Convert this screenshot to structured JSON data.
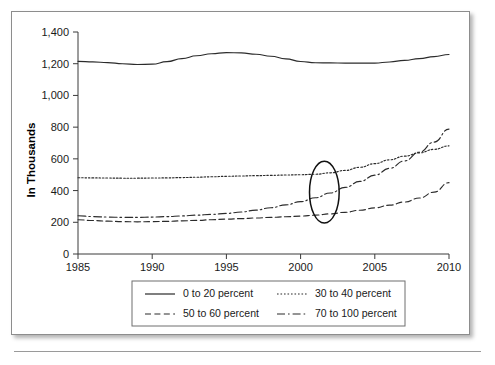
{
  "chart_data": {
    "type": "line",
    "title": "",
    "xlabel": "",
    "ylabel": "In Thousands",
    "xlim": [
      1985,
      2010
    ],
    "ylim": [
      0,
      1400
    ],
    "grid": false,
    "legend_position": "bottom",
    "x_ticks": [
      "1985",
      "1990",
      "1995",
      "2000",
      "2005",
      "2010"
    ],
    "x_tick_values": [
      1985,
      1990,
      1995,
      2000,
      2005,
      2010
    ],
    "y_ticks": [
      "0",
      "200",
      "400",
      "600",
      "800",
      "1,000",
      "1,200",
      "1,400"
    ],
    "y_tick_values": [
      0,
      200,
      400,
      600,
      800,
      1000,
      1200,
      1400
    ],
    "x": [
      1985,
      1986,
      1987,
      1988,
      1989,
      1990,
      1991,
      1992,
      1993,
      1994,
      1995,
      1996,
      1997,
      1998,
      1999,
      2000,
      2001,
      2002,
      2003,
      2004,
      2005,
      2006,
      2007,
      2008,
      2009,
      2010
    ],
    "series": [
      {
        "name": "0 to 20 percent",
        "style": "solid",
        "values": [
          1215,
          1212,
          1207,
          1200,
          1195,
          1197,
          1213,
          1232,
          1250,
          1263,
          1270,
          1268,
          1260,
          1247,
          1231,
          1214,
          1206,
          1205,
          1204,
          1204,
          1204,
          1211,
          1221,
          1232,
          1245,
          1258
        ]
      },
      {
        "name": "30 to 40 percent",
        "style": "dotted",
        "values": [
          481,
          480,
          479,
          478,
          478,
          479,
          480,
          482,
          484,
          487,
          490,
          492,
          494,
          496,
          498,
          500,
          503,
          512,
          527,
          547,
          570,
          594,
          617,
          638,
          660,
          682
        ]
      },
      {
        "name": "50 to 60 percent",
        "style": "dashed",
        "values": [
          216,
          211,
          207,
          204,
          203,
          204,
          206,
          209,
          212,
          216,
          220,
          223,
          227,
          231,
          235,
          239,
          245,
          253,
          263,
          276,
          291,
          308,
          328,
          353,
          390,
          450
        ]
      },
      {
        "name": "70 to 100 percent",
        "style": "dashdot",
        "values": [
          241,
          236,
          233,
          231,
          231,
          233,
          236,
          240,
          245,
          250,
          256,
          265,
          277,
          292,
          310,
          330,
          355,
          385,
          420,
          458,
          497,
          540,
          587,
          642,
          706,
          788
        ]
      }
    ],
    "annotation": {
      "name": "highlight-ellipse",
      "shape": "ellipse",
      "center_x": 2001.6,
      "center_y": 390,
      "radius_x_years": 1.0,
      "radius_y_value": 195
    }
  },
  "legend": {
    "entries": [
      {
        "label": "0 to 20 percent",
        "style": "solid"
      },
      {
        "label": "30 to 40 percent",
        "style": "dotted"
      },
      {
        "label": "50 to 60 percent",
        "style": "dashed"
      },
      {
        "label": "70 to 100 percent",
        "style": "dashdot"
      }
    ]
  },
  "colors": {
    "line": "#2b2b2b",
    "axis": "#3a3a3a",
    "card_border": "#8d8d8d",
    "background": "#ffffff"
  }
}
